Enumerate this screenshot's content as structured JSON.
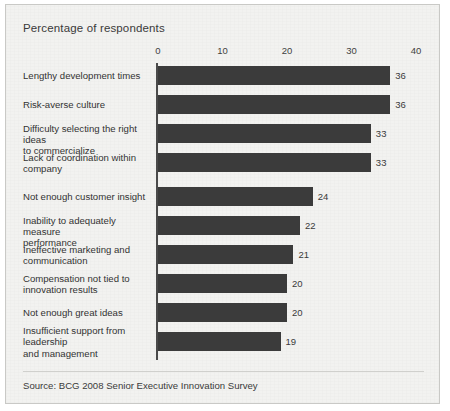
{
  "chart_title": "Percentage of respondents",
  "source_note": "Source: BCG 2008 Senior Executive Innovation Survey",
  "chart_data": {
    "type": "bar",
    "orientation": "horizontal",
    "title": "Percentage of respondents",
    "xlabel": "",
    "ylabel": "",
    "xlim": [
      0,
      40
    ],
    "grid": false,
    "legend": false,
    "bar_color": "#3b3b3b",
    "background_color": "#f2f2f0",
    "xticks": [
      0,
      10,
      20,
      30,
      40
    ],
    "xtick_labels": [
      "0",
      "10",
      "20",
      "30",
      "40"
    ],
    "categories": [
      "Lengthy development times",
      "Risk-averse culture",
      "Difficulty selecting the right ideas to commercialize",
      "Lack of coordination within company",
      "Not enough customer insight",
      "Inability to adequately measure performance",
      "Ineffective marketing and communication",
      "Compensation not tied to innovation results",
      "Not enough great ideas",
      "Insufficient support from leadership and management"
    ],
    "values": [
      36,
      36,
      33,
      33,
      24,
      22,
      21,
      20,
      20,
      19
    ],
    "data_labels": [
      "36",
      "36",
      "33",
      "33",
      "24",
      "22",
      "21",
      "20",
      "20",
      "19"
    ],
    "source": "Source: BCG 2008 Senior Executive Innovation Survey"
  },
  "bars": [
    {
      "label_lines": [
        "Lengthy development times"
      ],
      "value": 36,
      "value_label": "36"
    },
    {
      "label_lines": [
        "Risk-averse culture"
      ],
      "value": 36,
      "value_label": "36"
    },
    {
      "label_lines": [
        "Difficulty selecting the right ideas",
        "to commercialize"
      ],
      "value": 33,
      "value_label": "33"
    },
    {
      "label_lines": [
        "Lack of coordination within",
        "company"
      ],
      "value": 33,
      "value_label": "33"
    },
    {
      "label_lines": [
        "Not enough customer insight"
      ],
      "value": 24,
      "value_label": "24"
    },
    {
      "label_lines": [
        "Inability to adequately measure",
        "performance"
      ],
      "value": 22,
      "value_label": "22"
    },
    {
      "label_lines": [
        "Ineffective marketing and",
        "communication"
      ],
      "value": 21,
      "value_label": "21"
    },
    {
      "label_lines": [
        "Compensation not tied to",
        "innovation results"
      ],
      "value": 20,
      "value_label": "20"
    },
    {
      "label_lines": [
        "Not enough great ideas"
      ],
      "value": 20,
      "value_label": "20"
    },
    {
      "label_lines": [
        "Insufficient support from",
        "leadership",
        "and management"
      ],
      "value": 19,
      "value_label": "19"
    }
  ]
}
